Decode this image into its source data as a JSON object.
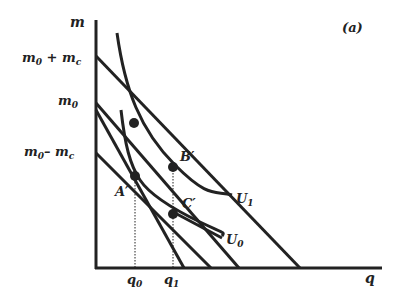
{
  "panel_label": "(a)",
  "axes": {
    "y_label": "m",
    "x_label": "q",
    "y_ticks": [
      {
        "id": "m0_plus_mc",
        "base": "m",
        "sub": "0",
        "suffix": " + m",
        "suffix_sub": "c"
      },
      {
        "id": "m0",
        "base": "m",
        "sub": "0"
      },
      {
        "id": "m0_minus_mc",
        "base": "m",
        "sub": "0",
        "suffix": "– m",
        "suffix_sub": "c"
      }
    ],
    "x_ticks": [
      {
        "id": "q0",
        "base": "q",
        "sub": "0"
      },
      {
        "id": "q1",
        "base": "q",
        "sub": "1"
      }
    ]
  },
  "curves": {
    "U1": {
      "base": "U",
      "sub": "1"
    },
    "U0": {
      "base": "U",
      "sub": "0"
    }
  },
  "points": {
    "B": "B′",
    "A": "A′",
    "C": "C′"
  },
  "colors": {
    "line": "#222222",
    "background": "#ffffff"
  }
}
